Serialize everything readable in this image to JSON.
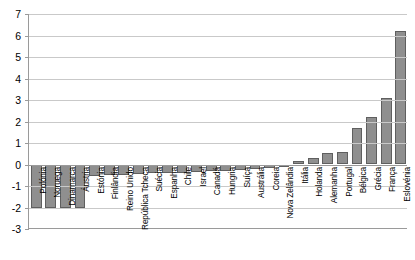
{
  "chart_data": {
    "type": "bar",
    "title": "",
    "subtitle": "",
    "xlabel": "",
    "ylabel": "",
    "ylim": [
      -3,
      7
    ],
    "ytick_step": 1,
    "yticks": [
      7,
      6,
      5,
      4,
      3,
      2,
      1,
      0,
      -1,
      -2,
      -3
    ],
    "ytick_labels": [
      "7",
      "6",
      "5",
      "4",
      "3",
      "2",
      "1",
      "0",
      "-1",
      "-2",
      "-3"
    ],
    "grid": true,
    "grid_axis": "y",
    "legend": false,
    "legend_position": "none",
    "orientation": "vertical",
    "sorted": "ascending",
    "bar_color": "#8f8f8f",
    "bar_border_color": "#5f5f5f",
    "gridline_color": "#c9c9c9",
    "axis_color": "#9a9a9a",
    "plot_background": "#ffffff",
    "label_rotation": -90,
    "categories": [
      "Polónia",
      "Noruega",
      "Dinamarca",
      "Áustria",
      "Estónia",
      "Finlândia",
      "Reino Unido",
      "República Tcheca",
      "Suécia",
      "Espanha",
      "Chile",
      "Israel",
      "Canadá",
      "Hungria",
      "Suíça",
      "Austrália",
      "Coreia",
      "Nova Zelândia",
      "Itália",
      "Holanda",
      "Alemanha",
      "Portugal",
      "Bélgica",
      "Grécia",
      "França",
      "Eslovénia"
    ],
    "values": [
      -2.0,
      -2.0,
      -2.0,
      -2.0,
      -0.55,
      -0.5,
      -0.5,
      -0.45,
      -0.4,
      -0.4,
      -0.4,
      -0.35,
      -0.3,
      -0.3,
      -0.25,
      -0.2,
      -0.15,
      -0.1,
      0.15,
      0.3,
      0.55,
      0.6,
      1.7,
      2.2,
      3.1,
      6.2
    ]
  }
}
